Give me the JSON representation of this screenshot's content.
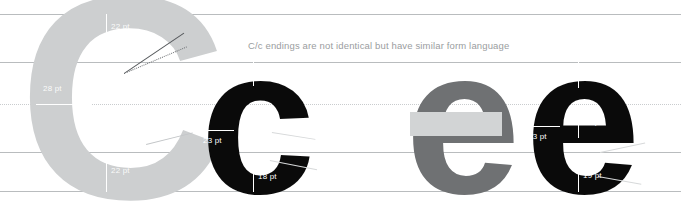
{
  "figure": {
    "caption": "C/c endings are not identical but have similar form language",
    "background_color": "#ffffff",
    "guide_color": "#b9bcbe",
    "midline_color": "#c9ccce"
  },
  "colors": {
    "light_grey_glyph": "#cdcfd0",
    "mid_grey_glyph": "#6f7173",
    "black_glyph": "#0a0a0a",
    "overlay_bar": "#d2d4d5",
    "caption_text": "#9a9da0",
    "label_text": "#ffffff"
  },
  "guidelines": [
    {
      "name": "cap-line",
      "y": 14,
      "style": "solid"
    },
    {
      "name": "x-height",
      "y": 62,
      "style": "solid"
    },
    {
      "name": "midline",
      "y": 104,
      "style": "dotted"
    },
    {
      "name": "baseline",
      "y": 152,
      "style": "solid"
    },
    {
      "name": "descender",
      "y": 191,
      "style": "solid"
    }
  ],
  "glyphs": [
    {
      "id": "grey-capital-c",
      "character": "C",
      "case": "uppercase",
      "color": "#cdcfd0",
      "labels": [
        {
          "name": "top-terminal-weight",
          "value": "22 pt"
        },
        {
          "name": "stem-weight",
          "value": "28 pt"
        },
        {
          "name": "bottom-terminal-weight",
          "value": "22 pt"
        }
      ]
    },
    {
      "id": "black-lowercase-c",
      "character": "c",
      "case": "lowercase",
      "color": "#0a0a0a",
      "labels": [
        {
          "name": "top-terminal-weight",
          "value": "18 pt"
        },
        {
          "name": "stem-weight",
          "value": "23 pt"
        },
        {
          "name": "bottom-terminal-weight",
          "value": "18 pt"
        }
      ]
    },
    {
      "id": "grey-lowercase-e",
      "character": "e",
      "case": "lowercase",
      "color": "#6f7173",
      "labels": []
    },
    {
      "id": "black-lowercase-e",
      "character": "e",
      "case": "lowercase",
      "color": "#0a0a0a",
      "labels": [
        {
          "name": "top-arch-weight",
          "value": "17 pt"
        },
        {
          "name": "crossbar-weight",
          "value": "16 pt"
        },
        {
          "name": "stem-weight",
          "value": "23 pt"
        },
        {
          "name": "bottom-terminal-weight",
          "value": "19 pt"
        }
      ]
    }
  ]
}
